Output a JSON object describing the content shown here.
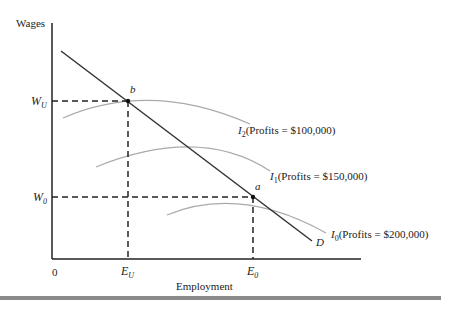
{
  "diagram": {
    "y_axis_label": "Wages",
    "x_axis_label": "Employment",
    "origin_label": "0",
    "y_ticks": [
      {
        "main": "W",
        "sub": "U"
      },
      {
        "main": "W",
        "sub": "0"
      }
    ],
    "x_ticks": [
      {
        "main": "E",
        "sub": "U"
      },
      {
        "main": "E",
        "sub": "0"
      }
    ],
    "points": [
      {
        "label": "b"
      },
      {
        "label": "a"
      }
    ],
    "demand_label": "D",
    "curves": [
      {
        "name": "I",
        "sub": "2",
        "text": "(Profits = $100,000)"
      },
      {
        "name": "I",
        "sub": "1",
        "text": "(Profits = $150,000)"
      },
      {
        "name": "I",
        "sub": "0",
        "text": "(Profits = $200,000)"
      }
    ],
    "colors": {
      "axis": "#222222",
      "demand": "#333333",
      "isoprofit": "#a8a8a8",
      "bar": "#8a8a8a"
    }
  }
}
